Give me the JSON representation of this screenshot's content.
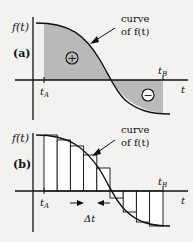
{
  "panel_a": {
    "label": "(a)",
    "y_axis_label": "f(t)",
    "x_axis_label": "t",
    "t_a_label": "t",
    "t_a_sub": "A",
    "t_b_label": "t",
    "t_b_sub": "B",
    "curve_label_line1": "curve",
    "curve_label_line2": "of f(t)",
    "positive_symbol": "+",
    "negative_symbol": "−",
    "fill_color": "#b9b9b9"
  },
  "panel_b": {
    "label": "(b)",
    "y_axis_label": "f(t)",
    "x_axis_label": "t",
    "t_a_label": "t",
    "t_a_sub": "A",
    "t_b_label": "t",
    "t_b_sub": "B",
    "curve_label_line1": "curve",
    "curve_label_line2": "of f(t)",
    "delta_label": "Δt",
    "rectangle_count": 9
  },
  "colors": {
    "line": "#111111",
    "background": "#f2f2f0",
    "shade": "#b9b9b9",
    "rect_fill": "#ffffff"
  }
}
